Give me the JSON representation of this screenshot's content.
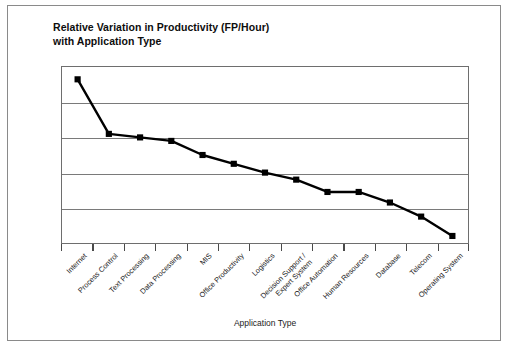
{
  "figure": {
    "title_line1": "Relative Variation in Productivity (FP/Hour)",
    "title_line2": "with Application Type",
    "frame_color": "#8a8a8a",
    "plot_border_color": "#6e6e6e",
    "gridline_color": "#7a7a7a",
    "series_color": "#000000",
    "background": "#ffffff"
  },
  "chart_data": {
    "type": "line",
    "title": "Relative Variation in Productivity (FP/Hour) with Application Type",
    "xlabel": "Application Type",
    "ylabel": "",
    "grid": true,
    "legend": "none",
    "y_gridline_count": 4,
    "ylim": [
      0,
      100
    ],
    "y_tick_labels": [],
    "marker": "square",
    "categories": [
      "Internet",
      "Process Control",
      "Text Processing",
      "Data Processing",
      "MIS",
      "Office Productivity",
      "Logistics",
      "Decision Support / Expert System",
      "Office Automation",
      "Human Resources",
      "Database",
      "Telecom",
      "Operating System"
    ],
    "category_labels": [
      {
        "line1": "Internet",
        "line2": ""
      },
      {
        "line1": "Process Control",
        "line2": ""
      },
      {
        "line1": "Text Processing",
        "line2": ""
      },
      {
        "line1": "Data Processing",
        "line2": ""
      },
      {
        "line1": "MIS",
        "line2": ""
      },
      {
        "line1": "Office Productivity",
        "line2": ""
      },
      {
        "line1": "Logistics",
        "line2": ""
      },
      {
        "line1": "Decision Support /",
        "line2": "Expert System"
      },
      {
        "line1": "Office Automation",
        "line2": ""
      },
      {
        "line1": "Human Resources",
        "line2": ""
      },
      {
        "line1": "Database",
        "line2": ""
      },
      {
        "line1": "Telecom",
        "line2": ""
      },
      {
        "line1": "Operating System",
        "line2": ""
      }
    ],
    "values": [
      93,
      62,
      60,
      58,
      50,
      45,
      40,
      36,
      29,
      29,
      23,
      15,
      4
    ]
  }
}
